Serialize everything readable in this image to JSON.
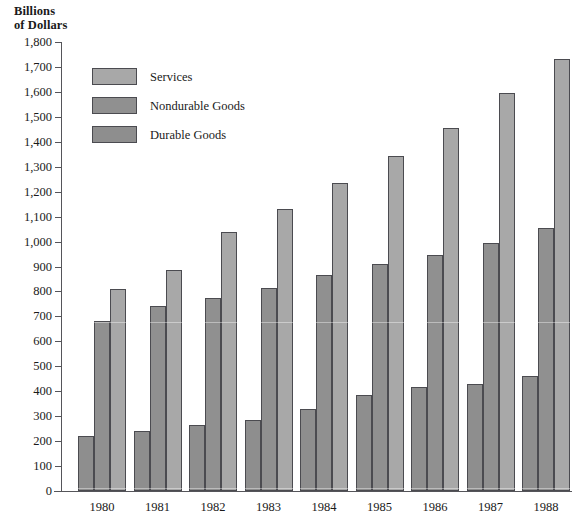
{
  "chart_data": {
    "type": "bar",
    "title": "Billions of Dollars",
    "title_line1": "Billions",
    "title_line2": "of Dollars",
    "xlabel": "",
    "ylabel": "Billions of Dollars",
    "ylim": [
      0,
      1800
    ],
    "ytick_step": 100,
    "grid": false,
    "legend_position": "upper-left inside plot",
    "categories": [
      "1980",
      "1981",
      "1982",
      "1983",
      "1984",
      "1985",
      "1986",
      "1987",
      "1988"
    ],
    "ytick_labels": [
      "1,800",
      "1,700",
      "1,600",
      "1,500",
      "1,400",
      "1,300",
      "1,200",
      "1,100",
      "1,000",
      "900",
      "800",
      "700",
      "600",
      "500",
      "400",
      "300",
      "200",
      "100",
      "0"
    ],
    "ytick_values": [
      1800,
      1700,
      1600,
      1500,
      1400,
      1300,
      1200,
      1100,
      1000,
      900,
      800,
      700,
      600,
      500,
      400,
      300,
      200,
      100,
      0
    ],
    "series": [
      {
        "name": "Durable Goods",
        "color": "#8e8e8e",
        "values": [
          220,
          240,
          265,
          285,
          330,
          385,
          415,
          430,
          460
        ]
      },
      {
        "name": "Nondurable Goods",
        "color": "#909090",
        "values": [
          680,
          740,
          775,
          815,
          865,
          910,
          945,
          995,
          1055
        ]
      },
      {
        "name": "Services",
        "color": "#a8a8a8",
        "values": [
          810,
          885,
          1040,
          1130,
          1235,
          1345,
          1455,
          1595,
          1730
        ]
      }
    ],
    "legend_order": [
      "Services",
      "Nondurable Goods",
      "Durable Goods"
    ],
    "bar_order_in_group": [
      "Durable Goods",
      "Nondurable Goods",
      "Services"
    ]
  },
  "legend": {
    "items": [
      {
        "label": "Services",
        "color": "#a8a8a8"
      },
      {
        "label": "Nondurable Goods",
        "color": "#909090"
      },
      {
        "label": "Durable Goods",
        "color": "#8e8e8e"
      }
    ]
  }
}
